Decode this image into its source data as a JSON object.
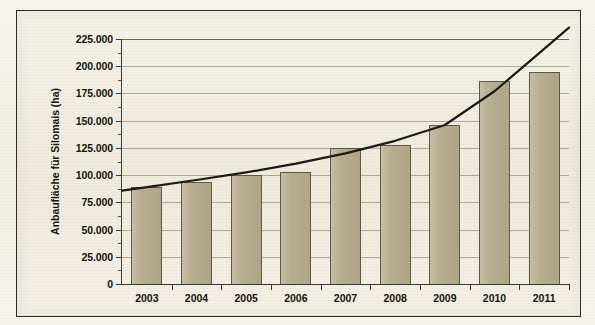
{
  "chart_data": {
    "type": "bar",
    "title": "",
    "subtitle": "",
    "xlabel": "",
    "ylabel": "Anbaufläche für Silomais (ha)",
    "categories": [
      "2003",
      "2004",
      "2005",
      "2006",
      "2007",
      "2008",
      "2009",
      "2010",
      "2011"
    ],
    "values": [
      89000,
      94000,
      100000,
      103000,
      124500,
      127500,
      146000,
      186000,
      195000
    ],
    "series": [
      {
        "name": "Anbaufläche für Silomais (ha)",
        "type": "bar",
        "values": [
          89000,
          94000,
          100000,
          103000,
          124500,
          127500,
          146000,
          186000,
          195000
        ]
      },
      {
        "name": "Trendlinie",
        "type": "line",
        "values": [
          89000,
          95500,
          102500,
          110500,
          120000,
          131500,
          146000,
          177000,
          216000
        ]
      }
    ],
    "ylim": [
      0,
      225000
    ],
    "yticks": [
      0,
      25000,
      50000,
      75000,
      100000,
      125000,
      150000,
      175000,
      200000,
      225000
    ],
    "ytick_labels": [
      "0",
      "25.000",
      "50.000",
      "75.000",
      "100.000",
      "125.000",
      "150.000",
      "175.000",
      "200.000",
      "225.000"
    ],
    "grid": true,
    "legend": "none",
    "colors": {
      "bar_fill": "#b5ab8c",
      "bar_border": "#5d5848",
      "trend_line": "#1b1a15",
      "grid": "#787260",
      "axis": "#3a3a35",
      "plot_background": "#efebdd",
      "page_background": "#f2efe6"
    }
  }
}
